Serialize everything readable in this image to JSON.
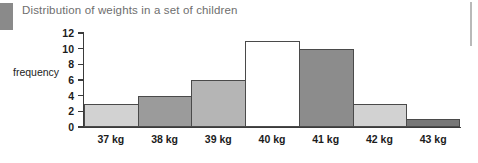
{
  "chart_title": "Distribution of weights in a set of children",
  "axes": {
    "ylabel": "frequency",
    "xlabel": "",
    "y_ticks": [
      "0",
      "2",
      "4",
      "6",
      "8",
      "10",
      "12"
    ]
  },
  "chart_data": {
    "type": "bar",
    "title": "Distribution of weights in a set of children",
    "xlabel": "",
    "ylabel": "frequency",
    "categories": [
      "37 kg",
      "38 kg",
      "39 kg",
      "40 kg",
      "41 kg",
      "42 kg",
      "43 kg"
    ],
    "values": [
      3,
      4,
      6,
      11,
      10,
      3,
      1
    ],
    "bar_colors": [
      "#d2d2d2",
      "#9b9b9b",
      "#b5b5b5",
      "#ffffff",
      "#8c8c8c",
      "#d2d2d2",
      "#777777"
    ],
    "bar_edge_color": "#4a4a4a",
    "ylim": [
      0,
      12
    ],
    "y_tick_step": 2,
    "grid": false,
    "legend": false
  },
  "decor": {
    "margin_block_color": "#8a8a8a",
    "right_rule_color": "#b9b9b9",
    "title_color": "#6e6e6e"
  }
}
